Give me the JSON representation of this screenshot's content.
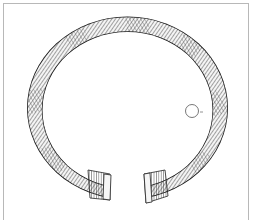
{
  "figure": {
    "subject": "twisted open-ended bracelet (torc) line drawing",
    "section_label": "",
    "colors": {
      "line": "#1a1a1a",
      "hatch": "#444444",
      "frame": "#b8b8b8",
      "background": "#ffffff"
    }
  }
}
